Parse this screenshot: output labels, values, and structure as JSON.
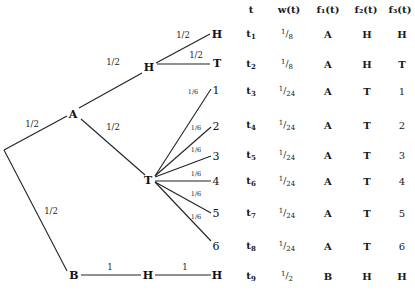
{
  "tree": {
    "root": {
      "label": ""
    },
    "nodes": {
      "A": "A",
      "H_mid": "H",
      "T_mid": "T",
      "B": "B",
      "BH_mid": "H",
      "BH_leaf": "H",
      "HH_leaf": "H",
      "HT_leaf": "T"
    },
    "die_leaves": [
      "1",
      "2",
      "3",
      "4",
      "5",
      "6"
    ],
    "edge_probs": {
      "root_A": "1/2",
      "root_B": "1/2",
      "A_H": "1/2",
      "A_T": "1/2",
      "H_H": "1/2",
      "H_T": "1/2",
      "T_die": "1/6",
      "B_H": "1",
      "H_H_bottom": "1"
    }
  },
  "table": {
    "headers": {
      "t": "t",
      "w": "w(t)",
      "f1": "f₁(t)",
      "f2": "f₂(t)",
      "f3": "f₃(t)"
    },
    "rows": [
      {
        "t": "t",
        "sub": "1",
        "w_num": "1",
        "w_den": "8",
        "f1": "A",
        "f2": "H",
        "f3": "H"
      },
      {
        "t": "t",
        "sub": "2",
        "w_num": "1",
        "w_den": "8",
        "f1": "A",
        "f2": "H",
        "f3": "T"
      },
      {
        "t": "t",
        "sub": "3",
        "w_num": "1",
        "w_den": "24",
        "f1": "A",
        "f2": "T",
        "f3": "1"
      },
      {
        "t": "t",
        "sub": "4",
        "w_num": "1",
        "w_den": "24",
        "f1": "A",
        "f2": "T",
        "f3": "2"
      },
      {
        "t": "t",
        "sub": "5",
        "w_num": "1",
        "w_den": "24",
        "f1": "A",
        "f2": "T",
        "f3": "3"
      },
      {
        "t": "t",
        "sub": "6",
        "w_num": "1",
        "w_den": "24",
        "f1": "A",
        "f2": "T",
        "f3": "4"
      },
      {
        "t": "t",
        "sub": "7",
        "w_num": "1",
        "w_den": "24",
        "f1": "A",
        "f2": "T",
        "f3": "5"
      },
      {
        "t": "t",
        "sub": "8",
        "w_num": "1",
        "w_den": "24",
        "f1": "A",
        "f2": "T",
        "f3": "6"
      },
      {
        "t": "t",
        "sub": "9",
        "w_num": "1",
        "w_den": "2",
        "f1": "B",
        "f2": "H",
        "f3": "H"
      }
    ]
  }
}
